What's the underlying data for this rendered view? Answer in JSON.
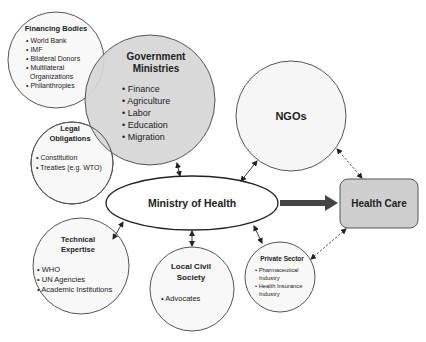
{
  "nodes": {
    "financing": {
      "title": "Financing Bodies",
      "items": [
        "• World Bank",
        "• IMF",
        "• Bilateral Donors",
        "• Multilateral",
        "  Organizations",
        "• Philanthropies"
      ]
    },
    "government": {
      "title1": "Government",
      "title2": "Ministries",
      "items": [
        "• Finance",
        "• Agriculture",
        "• Labor",
        "• Education",
        "• Migration"
      ]
    },
    "legal": {
      "title1": "Legal",
      "title2": "Obligations",
      "items": [
        "• Constitution",
        "• Treaties (e.g. WTO)"
      ]
    },
    "ngos": {
      "title": "NGOs"
    },
    "moh": {
      "title": "Ministry of Health"
    },
    "healthcare": {
      "title": "Health Care"
    },
    "technical": {
      "title1": "Technical",
      "title2": "Expertise",
      "items": [
        "• WHO",
        "• UN Agencies",
        "• Academic Institutions"
      ]
    },
    "civil": {
      "title1": "Local Civil",
      "title2": "Society",
      "items": [
        "• Advocates"
      ]
    },
    "private": {
      "title": "Private Sector",
      "items": [
        "• Pharmaceutical",
        "  Industry",
        "• Health Insurance",
        "  Industry"
      ]
    }
  },
  "colors": {
    "stroke": "#444444",
    "gov_fill": "#d6d6d6",
    "hc_fill": "#cfcfcf",
    "circle_fill": "#f7f7f7"
  }
}
